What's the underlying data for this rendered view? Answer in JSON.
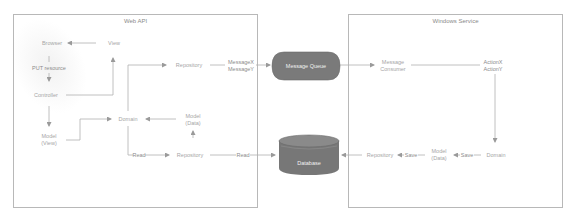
{
  "colors": {
    "line": "#b0b0b0",
    "arrow": "#9a9a9a",
    "text": "#a6a6a6",
    "boundary": "#b8b8b8",
    "queue_fill": "#7a7a7a",
    "db_fill": "#777777"
  },
  "web_api": {
    "title": "Web API",
    "nodes": {
      "browser": "Browser",
      "view": "View",
      "put_resource": "PUT resource",
      "controller": "Controller",
      "model_view_line1": "Model",
      "model_view_line2": "(View)",
      "domain": "Domain",
      "model_data_line1": "Model",
      "model_data_line2": "(Data)",
      "repository_top": "Repository",
      "repository_bottom": "Repository",
      "read_left": "Read",
      "read_right": "Read"
    }
  },
  "middle": {
    "message_x": "MessageX",
    "message_y": "MessageY",
    "message_queue": "Message Queue",
    "database": "Database"
  },
  "windows_service": {
    "title": "Windows Service",
    "nodes": {
      "message_consumer_line1": "Message",
      "message_consumer_line2": "Consumer",
      "action_x": "ActionX",
      "action_y": "ActionY",
      "domain": "Domain",
      "save_right": "Save",
      "model_data_line1": "Model",
      "model_data_line2": "(Data)",
      "save_left": "Save",
      "repository": "Repository"
    }
  }
}
